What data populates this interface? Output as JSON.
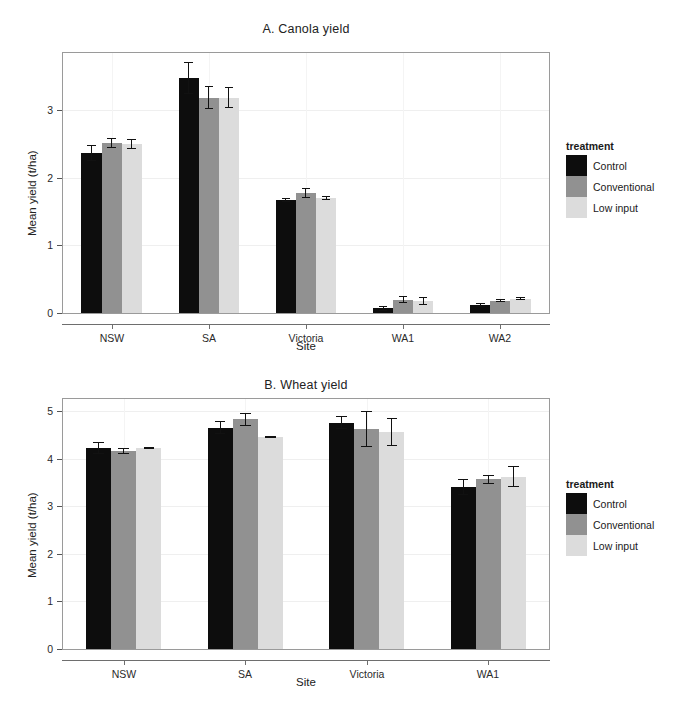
{
  "figure": {
    "background": "#ffffff",
    "width": 689,
    "height": 719
  },
  "legend": {
    "title": "treatment",
    "entries": [
      {
        "label": "Control",
        "color": "#0d0d0d"
      },
      {
        "label": "Conventional",
        "color": "#919191"
      },
      {
        "label": "Low input",
        "color": "#dcdcdc"
      }
    ]
  },
  "axis_titles": {
    "x": "Site",
    "y": "Mean yield (t/ha)"
  },
  "chart_data": [
    {
      "type": "bar",
      "title": "A. Canola yield",
      "xlabel": "Site",
      "ylabel": "Mean yield (t/ha)",
      "categories": [
        "NSW",
        "SA",
        "Victoria",
        "WA1",
        "WA2"
      ],
      "ylim": [
        0,
        3.85
      ],
      "yticks": [
        0,
        1,
        2,
        3
      ],
      "ytick_labels": [
        "0",
        "1",
        "2",
        "3"
      ],
      "grid": true,
      "legend_position": "right",
      "error_bars": "standard error",
      "series": [
        {
          "name": "Control",
          "color": "#0d0d0d",
          "values": [
            2.37,
            3.48,
            1.68,
            0.07,
            0.12
          ],
          "errors": [
            0.12,
            0.24,
            0.03,
            0.04,
            0.03
          ]
        },
        {
          "name": "Conventional",
          "color": "#919191",
          "values": [
            2.52,
            3.19,
            1.78,
            0.2,
            0.18
          ],
          "errors": [
            0.07,
            0.17,
            0.07,
            0.05,
            0.02
          ]
        },
        {
          "name": "Low input",
          "color": "#dcdcdc",
          "values": [
            2.5,
            3.19,
            1.7,
            0.18,
            0.21
          ],
          "errors": [
            0.07,
            0.15,
            0.03,
            0.06,
            0.02
          ]
        }
      ]
    },
    {
      "type": "bar",
      "title": "B. Wheat yield",
      "xlabel": "Site",
      "ylabel": "Mean yield (t/ha)",
      "categories": [
        "NSW",
        "SA",
        "Victoria",
        "WA1"
      ],
      "ylim": [
        0,
        5.25
      ],
      "yticks": [
        0,
        1,
        2,
        3,
        4,
        5
      ],
      "ytick_labels": [
        "0",
        "1",
        "2",
        "3",
        "4",
        "5"
      ],
      "grid": true,
      "legend_position": "right",
      "error_bars": "standard error",
      "series": [
        {
          "name": "Control",
          "color": "#0d0d0d",
          "values": [
            4.22,
            4.65,
            4.75,
            3.4
          ],
          "errors": [
            0.13,
            0.14,
            0.14,
            0.16
          ]
        },
        {
          "name": "Conventional",
          "color": "#919191",
          "values": [
            4.16,
            4.82,
            4.62,
            3.56
          ],
          "errors": [
            0.07,
            0.14,
            0.37,
            0.1
          ]
        },
        {
          "name": "Low input",
          "color": "#dcdcdc",
          "values": [
            4.22,
            4.45,
            4.56,
            3.62
          ],
          "errors": [
            0.03,
            0.02,
            0.3,
            0.22
          ]
        }
      ]
    }
  ]
}
